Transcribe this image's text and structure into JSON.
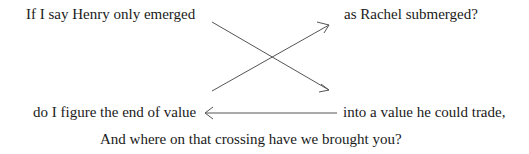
{
  "lines": {
    "top_left": "If I say Henry only emerged",
    "top_right": "as Rachel submerged?",
    "bottom_left": "do I figure the end of value",
    "bottom_right": "into a value he could trade,",
    "closing": "And where on that crossing have we brought you?"
  },
  "arrows": [
    {
      "from": "top_left",
      "to": "bottom_right",
      "type": "diagonal-down"
    },
    {
      "from": "bottom_left",
      "to": "top_right",
      "type": "diagonal-up"
    },
    {
      "from": "bottom_right",
      "to": "bottom_left",
      "type": "horizontal-left"
    }
  ],
  "colors": {
    "text": "#1a1a1a",
    "arrow": "#555555"
  }
}
